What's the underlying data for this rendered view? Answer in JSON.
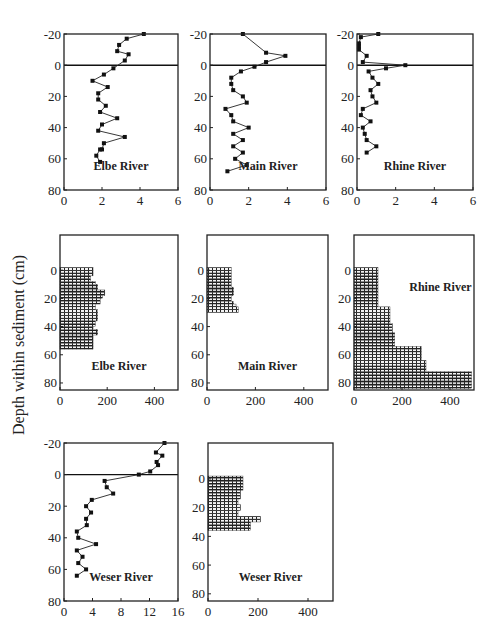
{
  "figure": {
    "shared_ylabel": "Depth within sediment (cm)"
  },
  "chart_data": [
    {
      "id": "elbe-line",
      "type": "line",
      "title": "Elbe River",
      "xlabel": "",
      "ylabel": "Depth within sediment (cm)",
      "xlim": [
        0,
        6
      ],
      "ylim": [
        80,
        -20
      ],
      "xticks": [
        0,
        2,
        4,
        6
      ],
      "yticks": [
        -20,
        0,
        20,
        40,
        60,
        80
      ],
      "reference_line_y": 0,
      "frame": {
        "x": 64,
        "y": 34,
        "w": 114,
        "h": 156
      },
      "x": [
        4.2,
        3.3,
        2.9,
        2.8,
        3.4,
        3.2,
        2.6,
        2.1,
        1.5,
        2.3,
        1.8,
        1.8,
        2.2,
        1.9,
        2.8,
        2.0,
        1.8,
        3.2,
        2.1,
        2.0,
        1.9,
        1.7,
        1.9
      ],
      "y": [
        -20,
        -17,
        -13,
        -9,
        -7,
        -3,
        2,
        6,
        10,
        14,
        18,
        22,
        26,
        30,
        34,
        38,
        42,
        46,
        50,
        54,
        54,
        58,
        62
      ]
    },
    {
      "id": "main-line",
      "type": "line",
      "title": "Main River",
      "xlim": [
        0,
        6
      ],
      "ylim": [
        80,
        -20
      ],
      "xticks": [
        0,
        2,
        4,
        6
      ],
      "yticks": [
        -20,
        0,
        20,
        40,
        60,
        80
      ],
      "reference_line_y": 0,
      "frame": {
        "x": 210,
        "y": 34,
        "w": 116,
        "h": 156
      },
      "x": [
        1.7,
        2.9,
        3.9,
        2.9,
        2.3,
        1.6,
        1.1,
        1.1,
        1.2,
        1.7,
        1.9,
        0.8,
        1.1,
        1.2,
        2.0,
        1.2,
        1.7,
        1.2,
        1.7,
        1.3,
        1.9,
        0.9
      ],
      "y": [
        -20,
        -8,
        -6,
        -2,
        1,
        4,
        8,
        12,
        16,
        20,
        24,
        28,
        32,
        36,
        40,
        44,
        48,
        52,
        56,
        60,
        64,
        68
      ]
    },
    {
      "id": "rhine-line",
      "type": "line",
      "title": "Rhine River",
      "xlim": [
        0,
        6
      ],
      "ylim": [
        80,
        -20
      ],
      "xticks": [
        0,
        2,
        4,
        6
      ],
      "yticks": [
        -20,
        0,
        20,
        40,
        60,
        80
      ],
      "reference_line_y": 0,
      "frame": {
        "x": 357,
        "y": 34,
        "w": 116,
        "h": 156
      },
      "x": [
        1.1,
        0.2,
        0.1,
        0.1,
        0.1,
        0.5,
        0.3,
        2.5,
        1.5,
        0.6,
        0.8,
        1.1,
        0.7,
        0.8,
        1.0,
        0.3,
        0.2,
        0.7,
        0.3,
        0.4,
        0.5,
        1.0,
        0.5
      ],
      "y": [
        -20,
        -18,
        -14,
        -12,
        -10,
        -6,
        -2,
        0,
        2,
        4,
        8,
        12,
        16,
        20,
        24,
        28,
        32,
        36,
        40,
        44,
        48,
        52,
        56
      ]
    },
    {
      "id": "elbe-bar",
      "type": "bar",
      "orientation": "horizontal",
      "title": "Elbe River",
      "xlim": [
        0,
        500
      ],
      "ylim": [
        85,
        -25
      ],
      "xticks": [
        0,
        200,
        400
      ],
      "yticks": [
        0,
        20,
        40,
        60,
        80
      ],
      "frame": {
        "x": 60,
        "y": 235,
        "w": 118,
        "h": 155
      },
      "bin_height_cm": 2,
      "depth_start": [
        -2,
        0,
        2,
        4,
        6,
        8,
        10,
        12,
        14,
        16,
        18,
        20,
        22,
        24,
        26,
        28,
        30,
        32,
        34,
        36,
        38,
        40,
        42,
        44,
        46,
        48,
        50,
        52,
        54
      ],
      "values": [
        140,
        140,
        140,
        130,
        130,
        150,
        160,
        160,
        190,
        190,
        180,
        170,
        170,
        150,
        150,
        160,
        160,
        160,
        160,
        150,
        150,
        140,
        160,
        160,
        140,
        140,
        140,
        140,
        140
      ]
    },
    {
      "id": "main-bar",
      "type": "bar",
      "orientation": "horizontal",
      "title": "Main River",
      "xlim": [
        0,
        500
      ],
      "ylim": [
        85,
        -25
      ],
      "xticks": [
        0,
        200,
        400
      ],
      "yticks": [
        0,
        20,
        40,
        60,
        80
      ],
      "frame": {
        "x": 207,
        "y": 235,
        "w": 121,
        "h": 155
      },
      "bin_height_cm": 2,
      "depth_start": [
        -2,
        0,
        2,
        4,
        6,
        8,
        10,
        12,
        14,
        16,
        18,
        20,
        22,
        24,
        26,
        28
      ],
      "values": [
        100,
        100,
        100,
        100,
        100,
        100,
        100,
        110,
        110,
        110,
        100,
        100,
        110,
        120,
        130,
        130
      ]
    },
    {
      "id": "rhine-bar",
      "type": "bar",
      "orientation": "horizontal",
      "title": "Rhine River",
      "xlim": [
        0,
        500
      ],
      "ylim": [
        85,
        -25
      ],
      "xticks": [
        0,
        200,
        400
      ],
      "yticks": [
        0,
        20,
        40,
        60,
        80
      ],
      "frame": {
        "x": 354,
        "y": 235,
        "w": 120,
        "h": 155
      },
      "bin_height_cm": 2,
      "depth_start": [
        -2,
        0,
        2,
        4,
        6,
        8,
        10,
        12,
        14,
        16,
        18,
        20,
        22,
        24,
        26,
        28,
        30,
        32,
        34,
        36,
        38,
        40,
        42,
        44,
        46,
        48,
        50,
        52,
        54,
        56,
        58,
        60,
        62,
        64,
        66,
        68,
        70,
        72,
        74,
        76,
        78,
        80,
        82
      ],
      "values": [
        100,
        100,
        100,
        100,
        100,
        100,
        100,
        100,
        100,
        100,
        100,
        100,
        100,
        100,
        150,
        150,
        150,
        150,
        150,
        150,
        160,
        160,
        160,
        170,
        170,
        170,
        170,
        170,
        280,
        280,
        280,
        280,
        280,
        300,
        300,
        300,
        300,
        490,
        490,
        490,
        490,
        490,
        490
      ]
    },
    {
      "id": "weser-line",
      "type": "line",
      "title": "Weser River",
      "xlim": [
        0,
        16
      ],
      "ylim": [
        80,
        -20
      ],
      "xticks": [
        0,
        4,
        8,
        12,
        16
      ],
      "yticks": [
        -20,
        0,
        20,
        40,
        60,
        80
      ],
      "reference_line_y": 0,
      "frame": {
        "x": 64,
        "y": 443,
        "w": 114,
        "h": 158
      },
      "x": [
        14.1,
        12.9,
        13.8,
        13.0,
        13.2,
        12.1,
        10.5,
        5.7,
        6.0,
        6.9,
        3.9,
        3.1,
        3.8,
        3.1,
        3.2,
        1.8,
        2.0,
        4.5,
        1.8,
        2.6,
        2.0,
        3.1,
        1.8
      ],
      "y": [
        -20,
        -14,
        -12,
        -8,
        -6,
        -2,
        0,
        4,
        8,
        12,
        16,
        20,
        24,
        28,
        32,
        36,
        40,
        44,
        48,
        52,
        56,
        60,
        64
      ]
    },
    {
      "id": "weser-bar",
      "type": "bar",
      "orientation": "horizontal",
      "title": "Weser River",
      "xlim": [
        0,
        500
      ],
      "ylim": [
        85,
        -25
      ],
      "xticks": [
        0,
        200,
        400
      ],
      "yticks": [
        0,
        20,
        40,
        60,
        80
      ],
      "frame": {
        "x": 208,
        "y": 443,
        "w": 125,
        "h": 158
      },
      "bin_height_cm": 2,
      "depth_start": [
        -2,
        0,
        2,
        4,
        6,
        8,
        10,
        12,
        14,
        16,
        18,
        20,
        22,
        24,
        26,
        28,
        30,
        32,
        34
      ],
      "values": [
        140,
        140,
        140,
        140,
        140,
        130,
        130,
        130,
        120,
        120,
        130,
        130,
        120,
        120,
        210,
        210,
        170,
        170,
        170
      ]
    }
  ]
}
